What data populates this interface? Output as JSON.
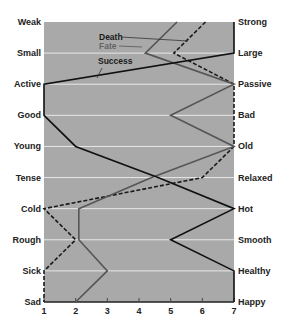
{
  "chart_data": {
    "type": "line",
    "title": "",
    "orientation": "horizontal-profile",
    "xlabel": "",
    "ylabel": "",
    "xlim": [
      1,
      7
    ],
    "x_ticks": [
      "1",
      "2",
      "3",
      "4",
      "5",
      "6",
      "7"
    ],
    "grid": true,
    "left_labels": [
      "Weak",
      "Small",
      "Active",
      "Good",
      "Young",
      "Tense",
      "Cold",
      "Rough",
      "Sick",
      "Sad"
    ],
    "right_labels": [
      "Strong",
      "Large",
      "Passive",
      "Bad",
      "Old",
      "Relaxed",
      "Hot",
      "Smooth",
      "Healthy",
      "Happy"
    ],
    "series": [
      {
        "name": "Death",
        "style": "dashed",
        "color": "#1a1a1a",
        "values": [
          6.1,
          5.1,
          7,
          7,
          7,
          6,
          1,
          2,
          1,
          1
        ]
      },
      {
        "name": "Fate",
        "style": "solid",
        "color": "#555555",
        "values": [
          5.2,
          4.2,
          7,
          5,
          7,
          4.4,
          2.1,
          2.1,
          3,
          2
        ]
      },
      {
        "name": "Success",
        "style": "solid",
        "color": "#111111",
        "values": [
          7,
          7,
          1,
          1,
          2,
          4.6,
          7,
          5,
          7,
          7
        ]
      }
    ],
    "legend_position": "annotations near top-left of plot"
  },
  "colors": {
    "plot_bg": "#a9a9a9",
    "gridline": "#e8e8e8",
    "axis": "#222222"
  }
}
